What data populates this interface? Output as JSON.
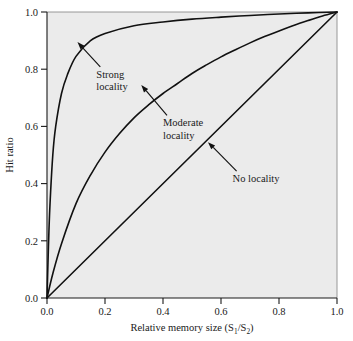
{
  "chart_data": {
    "type": "line",
    "title": "",
    "xlabel": "Relative memory size (S1/S2)",
    "xlabel_parts": {
      "main": "Relative memory size (S",
      "sub1": "1",
      "slash": "/S",
      "sub2": "2",
      "close": ")"
    },
    "ylabel": "Hit ratio",
    "xlim": [
      0.0,
      1.0
    ],
    "ylim": [
      0.0,
      1.0
    ],
    "grid": false,
    "legend_position": "inline-annotations",
    "xticks": [
      "0.0",
      "0.2",
      "0.4",
      "0.6",
      "0.8",
      "1.0"
    ],
    "xtick_values": [
      0.0,
      0.2,
      0.4,
      0.6,
      0.8,
      1.0
    ],
    "yticks": [
      "0.0",
      "0.2",
      "0.4",
      "0.6",
      "0.8",
      "1.0"
    ],
    "ytick_values": [
      0.0,
      0.2,
      0.4,
      0.6,
      0.8,
      1.0
    ],
    "plot_area_bg": "#ebebeb",
    "curve_color": "#111111",
    "series": [
      {
        "name": "Strong locality",
        "label_line1": "Strong",
        "label_line2": "locality",
        "x": [
          0.0,
          0.005,
          0.01,
          0.02,
          0.03,
          0.05,
          0.07,
          0.1,
          0.15,
          0.2,
          0.3,
          0.4,
          0.5,
          0.6,
          0.7,
          0.8,
          0.9,
          1.0
        ],
        "y": [
          0.0,
          0.18,
          0.32,
          0.5,
          0.6,
          0.715,
          0.78,
          0.845,
          0.9,
          0.925,
          0.952,
          0.965,
          0.975,
          0.982,
          0.988,
          0.993,
          0.997,
          1.0
        ]
      },
      {
        "name": "Moderate locality",
        "label_line1": "Moderate",
        "label_line2": "locality",
        "x": [
          0.0,
          0.02,
          0.05,
          0.1,
          0.15,
          0.2,
          0.25,
          0.3,
          0.35,
          0.4,
          0.45,
          0.5,
          0.55,
          0.6,
          0.65,
          0.7,
          0.75,
          0.8,
          0.85,
          0.9,
          0.95,
          1.0
        ],
        "y": [
          0.0,
          0.085,
          0.19,
          0.33,
          0.43,
          0.51,
          0.575,
          0.63,
          0.675,
          0.715,
          0.75,
          0.785,
          0.815,
          0.843,
          0.868,
          0.892,
          0.914,
          0.934,
          0.953,
          0.97,
          0.986,
          1.0
        ]
      },
      {
        "name": "No locality",
        "label_line1": "No locality",
        "label_line2": "",
        "x": [
          0.0,
          1.0
        ],
        "y": [
          0.0,
          1.0
        ]
      }
    ],
    "annotations": [
      {
        "text_line1": "Strong",
        "text_line2": "locality",
        "text_x": 0.17,
        "text_y": 0.77,
        "arrow_to_x": 0.105,
        "arrow_to_y": 0.895
      },
      {
        "text_line1": "Moderate",
        "text_line2": "locality",
        "text_x": 0.4,
        "text_y": 0.6,
        "arrow_to_x": 0.325,
        "arrow_to_y": 0.745
      },
      {
        "text_line1": "No locality",
        "text_line2": "",
        "text_x": 0.64,
        "text_y": 0.405,
        "arrow_to_x": 0.555,
        "arrow_to_y": 0.545
      }
    ]
  }
}
